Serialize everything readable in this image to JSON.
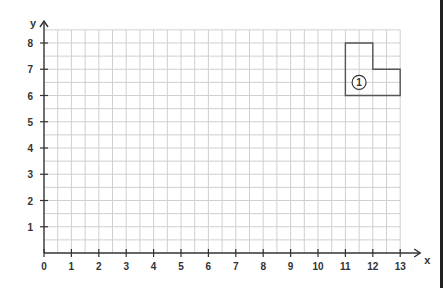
{
  "chart_data": {
    "type": "coordinate-grid",
    "title": "",
    "xlabel": "x",
    "ylabel": "y",
    "xlim": [
      0,
      13
    ],
    "ylim": [
      0,
      8.5
    ],
    "x_ticks": [
      "0",
      "1",
      "2",
      "3",
      "4",
      "5",
      "6",
      "7",
      "8",
      "9",
      "10",
      "11",
      "12",
      "13"
    ],
    "y_ticks": [
      "1",
      "2",
      "3",
      "4",
      "5",
      "6",
      "7",
      "8"
    ],
    "grid": {
      "on": true,
      "minor_step": 0.5
    },
    "shapes": [
      {
        "label": "①",
        "type": "polygon",
        "vertices": [
          [
            11,
            8
          ],
          [
            12,
            8
          ],
          [
            12,
            7
          ],
          [
            13,
            7
          ],
          [
            13,
            6
          ],
          [
            11,
            6
          ]
        ],
        "label_position": [
          11.5,
          6.5
        ]
      }
    ]
  },
  "colors": {
    "grid": "#cfcfcf",
    "axis": "#333333",
    "shape": "#555555",
    "border": "#222222"
  }
}
